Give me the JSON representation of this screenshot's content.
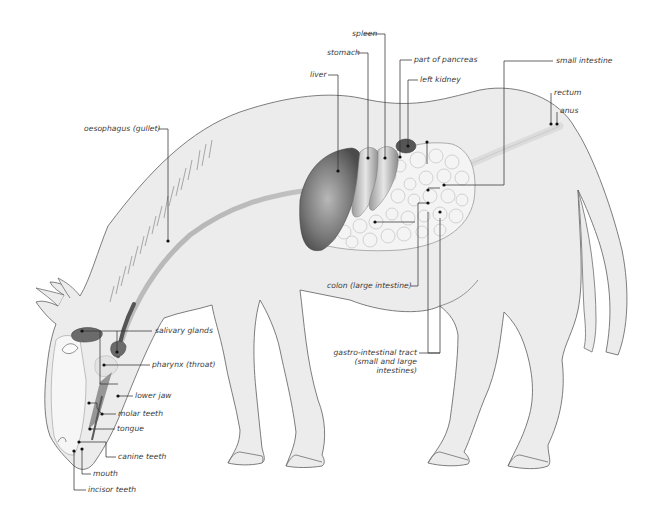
{
  "diagram": {
    "colors": {
      "background": "#ffffff",
      "body_fill": "#ececec",
      "outline": "#6f6f6f",
      "organ_dark": "#5a5a5a",
      "intestine_fill": "#f4f4f4",
      "leader_line": "#333333"
    },
    "labels": {
      "spleen": "spleen",
      "stomach": "stomach",
      "liver": "liver",
      "part_of_pancreas": "part of pancreas",
      "left_kidney": "left kidney",
      "small_intestine": "small intestine",
      "rectum": "rectum",
      "anus": "anus",
      "oesophagus": "oesophagus (gullet)",
      "salivary_glands": "salivary glands",
      "pharynx": "pharynx (throat)",
      "lower_jaw": "lower jaw",
      "molar_teeth": "molar teeth",
      "tongue": "tongue",
      "canine_teeth": "canine teeth",
      "mouth": "mouth",
      "incisor_teeth": "incisor teeth",
      "colon": "colon (large intestine)",
      "gi_tract_line1": "gastro-intestinal tract",
      "gi_tract_line2": "(small and large",
      "gi_tract_line3": "intestines)"
    }
  }
}
